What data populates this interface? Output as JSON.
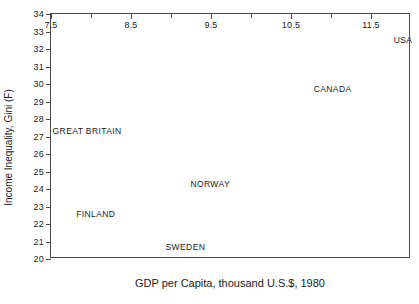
{
  "chart_data": {
    "type": "scatter",
    "title": "",
    "xlabel": "GDP per Capita, thousand U.S.$, 1980",
    "ylabel": "Income Inequality, Gini (F)",
    "xlim": [
      7.5,
      12.0
    ],
    "ylim": [
      20,
      34
    ],
    "grid": false,
    "legend": "none",
    "marker_style": "text-label-only",
    "xticks_labeled": [
      "7.5",
      "8.5",
      "9.5",
      "10.5",
      "11.5"
    ],
    "xticks_labeled_values": [
      7.5,
      8.5,
      9.5,
      10.5,
      11.5
    ],
    "xticks_minor_values": [
      8.0,
      9.0,
      10.0,
      11.0
    ],
    "yticks": [
      "20",
      "21",
      "22",
      "23",
      "24",
      "25",
      "26",
      "27",
      "28",
      "29",
      "30",
      "31",
      "32",
      "33",
      "34"
    ],
    "ytick_values": [
      20,
      21,
      22,
      23,
      24,
      25,
      26,
      27,
      28,
      29,
      30,
      31,
      32,
      33,
      34
    ],
    "points": [
      {
        "label": "USA",
        "x": 11.9,
        "y": 32.5,
        "anchor": "center"
      },
      {
        "label": "CANADA",
        "x": 11.02,
        "y": 29.7,
        "anchor": "center"
      },
      {
        "label": "GREAT BRITAIN",
        "x": 7.52,
        "y": 27.3,
        "anchor": "left"
      },
      {
        "label": "NORWAY",
        "x": 9.49,
        "y": 24.3,
        "anchor": "center"
      },
      {
        "label": "FINLAND",
        "x": 8.06,
        "y": 22.6,
        "anchor": "center"
      },
      {
        "label": "SWEDEN",
        "x": 9.18,
        "y": 20.7,
        "anchor": "center"
      }
    ]
  },
  "colors": {
    "axis": "#4a4a4a",
    "text": "#1a1a1a",
    "background": "#ffffff"
  }
}
